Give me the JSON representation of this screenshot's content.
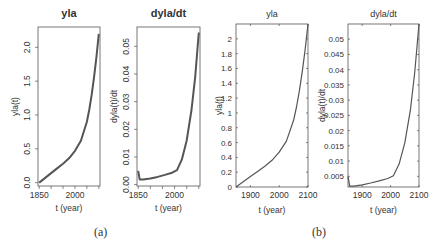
{
  "chart_data": [
    {
      "id": "a-yla",
      "type": "line",
      "title": "yla",
      "xlabel": "t (year)",
      "ylabel": "yla(t)",
      "xlim": [
        1845,
        2105
      ],
      "ylim": [
        -0.05,
        2.3
      ],
      "xticks": [
        1850,
        2000
      ],
      "xminor": [
        1900,
        1950,
        2050,
        2100
      ],
      "yticks": [
        0.0,
        0.5,
        1.0,
        1.5,
        2.0
      ],
      "ytick_labels": [
        "0.0",
        "0.5",
        "1.0",
        "1.5",
        "2.0"
      ],
      "x": [
        1850,
        1875,
        1900,
        1925,
        1950,
        1975,
        2000,
        2025,
        2050,
        2060,
        2070,
        2080,
        2090,
        2100
      ],
      "y": [
        0.0,
        0.07,
        0.14,
        0.21,
        0.28,
        0.36,
        0.47,
        0.62,
        0.9,
        1.08,
        1.3,
        1.55,
        1.85,
        2.2
      ],
      "style": "R base graphics, bold title, rotated y tick labels"
    },
    {
      "id": "a-dyla",
      "type": "line",
      "title": "dyla/dt",
      "xlabel": "t (year)",
      "ylabel": "dyla(t)/dt",
      "xlim": [
        1845,
        2105
      ],
      "ylim": [
        -0.0005,
        0.057
      ],
      "xticks": [
        1850,
        2000
      ],
      "xminor": [
        1900,
        1950,
        2050,
        2100
      ],
      "yticks": [
        0.0,
        0.01,
        0.02,
        0.03,
        0.04,
        0.05
      ],
      "ytick_labels": [
        "0.00",
        "0.01",
        "0.02",
        "0.03",
        "0.04",
        "0.05"
      ],
      "x": [
        1850,
        1856,
        1870,
        1900,
        1930,
        1960,
        1990,
        2010,
        2030,
        2050,
        2070,
        2085,
        2100
      ],
      "y": [
        0.005,
        0.0018,
        0.0018,
        0.0022,
        0.0028,
        0.0035,
        0.0043,
        0.0052,
        0.009,
        0.016,
        0.027,
        0.039,
        0.055
      ],
      "style": "R base graphics, bold title, rotated y tick labels"
    },
    {
      "id": "b-yla",
      "type": "line",
      "title": "yla",
      "xlabel": "t (year)",
      "ylabel": "yla(t)",
      "xlim": [
        1850,
        2100
      ],
      "ylim": [
        0,
        2.2
      ],
      "xticks": [
        1900,
        2000,
        2100
      ],
      "yticks": [
        0,
        0.2,
        0.4,
        0.6,
        0.8,
        1,
        1.2,
        1.4,
        1.6,
        1.8,
        2
      ],
      "ytick_labels": [
        "0",
        "0.2",
        "0.4",
        "0.6",
        "0.8",
        "1",
        "1.2",
        "1.4",
        "1.6",
        "1.8",
        "2"
      ],
      "x": [
        1850,
        1875,
        1900,
        1925,
        1950,
        1975,
        2000,
        2025,
        2050,
        2060,
        2070,
        2080,
        2090,
        2100
      ],
      "y": [
        0.0,
        0.07,
        0.14,
        0.21,
        0.28,
        0.36,
        0.47,
        0.62,
        0.9,
        1.08,
        1.3,
        1.55,
        1.85,
        2.2
      ],
      "style": "MATLAB-style, plain title, horizontal y tick labels"
    },
    {
      "id": "b-dyla",
      "type": "line",
      "title": "dyla/dt",
      "xlabel": "t (year)",
      "ylabel": "dyla(t)/dt",
      "xlim": [
        1850,
        2100
      ],
      "ylim": [
        0.0015,
        0.055
      ],
      "xticks": [
        1900,
        2000,
        2100
      ],
      "yticks": [
        0.005,
        0.01,
        0.015,
        0.02,
        0.025,
        0.03,
        0.035,
        0.04,
        0.045,
        0.05
      ],
      "ytick_labels": [
        "0.005",
        "0.01",
        "0.015",
        "0.02",
        "0.025",
        "0.03",
        "0.035",
        "0.04",
        "0.045",
        "0.05"
      ],
      "x": [
        1850,
        1856,
        1870,
        1900,
        1930,
        1960,
        1990,
        2010,
        2030,
        2050,
        2070,
        2085,
        2100
      ],
      "y": [
        0.005,
        0.0018,
        0.0018,
        0.0022,
        0.0028,
        0.0035,
        0.0043,
        0.0052,
        0.009,
        0.016,
        0.027,
        0.039,
        0.055
      ],
      "style": "MATLAB-style, plain title, horizontal y tick labels"
    }
  ],
  "captions": {
    "a": "(a)",
    "b": "(b)"
  },
  "panels": {
    "a_left": {
      "title": "yla",
      "xlabel": "t (year)",
      "ylabel": "yla(t)"
    },
    "a_right": {
      "title": "dyla/dt",
      "xlabel": "t (year)",
      "ylabel": "dyla(t)/dt"
    },
    "b_left": {
      "title": "yla",
      "xlabel": "t (year)",
      "ylabel": "yla(t)"
    },
    "b_right": {
      "title": "dyla/dt",
      "xlabel": "t (year)",
      "ylabel": "dyla(t)/dt"
    }
  },
  "colors": {
    "line": "#555555",
    "axis": "#555555",
    "text": "#333333"
  }
}
